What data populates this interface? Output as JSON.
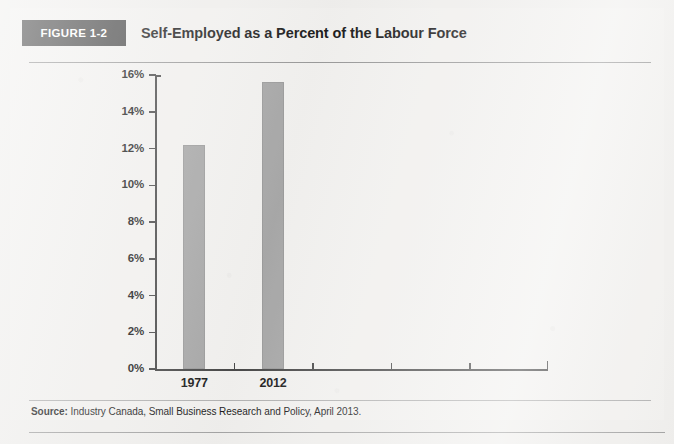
{
  "figure": {
    "badge_label": "FIGURE 1-2",
    "title": "Self-Employed as a Percent of the Labour Force",
    "source_prefix": "Source:",
    "source_text": " Industry Canada, Small Business Research and Policy, April 2013."
  },
  "colors": {
    "badge_background": "#4b4b4b",
    "badge_text": "#ffffff",
    "bar_fill": "#a9a9a9",
    "axis": "#4a4a4a",
    "page_background": "#f1f0ee",
    "rule": "#9b9b9b"
  },
  "chart_data": {
    "type": "bar",
    "title": "Self-Employed as a Percent of the Labour Force",
    "xlabel": "",
    "ylabel": "",
    "categories": [
      "1977",
      "2012"
    ],
    "values": [
      12.2,
      15.6
    ],
    "ylim": [
      0,
      16
    ],
    "ytick_labels": [
      "0%",
      "2%",
      "4%",
      "6%",
      "8%",
      "10%",
      "12%",
      "14%",
      "16%"
    ],
    "ytick_values": [
      0,
      2,
      4,
      6,
      8,
      10,
      12,
      14,
      16
    ],
    "yunit": "%",
    "grid": false,
    "legend": "none",
    "series": [
      {
        "name": "Self-employed share of labour force",
        "values": [
          12.2,
          15.6
        ]
      }
    ]
  }
}
